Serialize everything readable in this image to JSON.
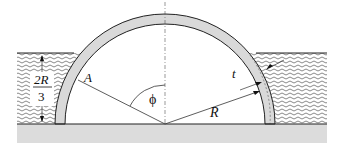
{
  "diagram": {
    "labels": {
      "A": "A",
      "phi": "ϕ",
      "R": "R",
      "t": "t",
      "depth_numerator": "2R",
      "depth_denominator": "3"
    },
    "colors": {
      "shell_fill": "#d9d9d9",
      "ground_fill": "#dcdcdc",
      "line": "#222222",
      "fluid_wave": "#555555",
      "background": "#ffffff"
    },
    "geometry": {
      "center": [
        165,
        124
      ],
      "outer_radius": 110,
      "inner_radius": 100,
      "fluid_top_y": 53,
      "ground_y": 124,
      "fluid_left_x": 17,
      "fluid_right_x": 327
    }
  }
}
